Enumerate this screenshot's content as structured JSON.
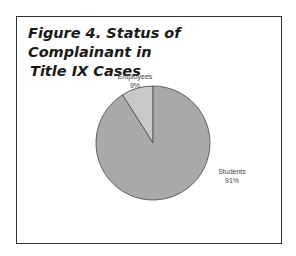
{
  "chart_data": {
    "type": "pie",
    "title": "Figure 4. Status of Complainant in Title IX Cases",
    "title_lines": [
      "Figure 4. Status of Complainant in",
      "Title IX Cases"
    ],
    "categories": [
      "Employees",
      "Students"
    ],
    "values": [
      9,
      91
    ],
    "labels": [
      {
        "name": "Employees",
        "pct": "9%"
      },
      {
        "name": "Students",
        "pct": "91%"
      }
    ],
    "colors": {
      "Employees": "#c8c8c8",
      "Students": "#a9a9a9"
    },
    "legend": "none (slice labels)"
  }
}
